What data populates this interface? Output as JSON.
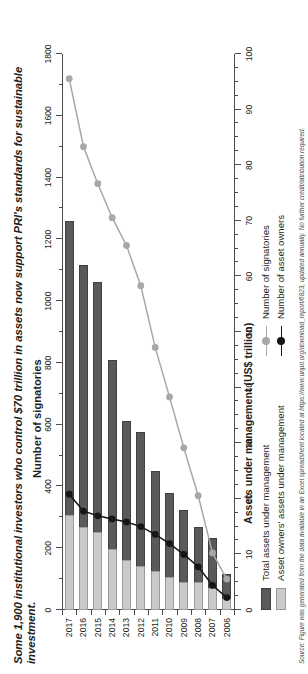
{
  "chart_data": {
    "type": "bar",
    "title": "Some 1,900 institutional investors who control $70 trillion in assets now support PRI's standards for sustainable investment.",
    "orientation": "horizontal",
    "categories": [
      "2006",
      "2007",
      "2008",
      "2009",
      "2010",
      "2011",
      "2012",
      "2013",
      "2014",
      "2015",
      "2016",
      "2017"
    ],
    "xlabel_primary": "Assets under management (US$ trillion)",
    "xlabel_secondary": "Number of signatories",
    "ylabel": "",
    "xlim_aum": [
      0,
      100
    ],
    "xlim_signatories": [
      0,
      1800
    ],
    "grid": false,
    "legend_position": "bottom",
    "series": [
      {
        "name": "Total assets under management",
        "type": "bar",
        "axis": "aum",
        "color": "#595a5c",
        "values": [
          6.5,
          13,
          15,
          18,
          21,
          25,
          32,
          34,
          45,
          59,
          62,
          70
        ]
      },
      {
        "name": "Asset owners' assets under management",
        "type": "bar",
        "axis": "aum",
        "color": "#c9cacb",
        "values": [
          2,
          4,
          5,
          5,
          6,
          7,
          8,
          9,
          11,
          14,
          15,
          17
        ]
      },
      {
        "name": "Number of signatories",
        "type": "line",
        "axis": "signatories",
        "color": "#a6a8ab",
        "values": [
          100,
          185,
          370,
          525,
          690,
          850,
          1050,
          1180,
          1270,
          1380,
          1500,
          1720
        ]
      },
      {
        "name": "Number of asset owners",
        "type": "line",
        "axis": "signatories",
        "color": "#161616",
        "values": [
          40,
          80,
          140,
          180,
          215,
          245,
          270,
          285,
          295,
          305,
          320,
          375
        ]
      }
    ],
    "ticks_signatories": [
      "0",
      "200",
      "400",
      "600",
      "800",
      "1000",
      "1200",
      "1400",
      "1600",
      "1800"
    ],
    "ticks_aum": [
      "0",
      "10",
      "20",
      "30",
      "40",
      "50",
      "60",
      "70",
      "80",
      "90",
      "100"
    ]
  },
  "legend": {
    "bars": [
      {
        "label": "Total assets under management",
        "swatch": "dark-swatch"
      },
      {
        "label": "Asset owners' assets under management",
        "swatch": "light-swatch"
      }
    ],
    "lines": [
      {
        "label": "Number of signatories",
        "key": "gray-line-marker"
      },
      {
        "label": "Number of asset owners",
        "key": "black-line-marker"
      }
    ]
  },
  "source": {
    "note": "Source: Figure was generated from the data available in an Excel spreadsheet located at https://www.unpri.org/download_report/6823, updated annually. No further credit/attribution required."
  }
}
